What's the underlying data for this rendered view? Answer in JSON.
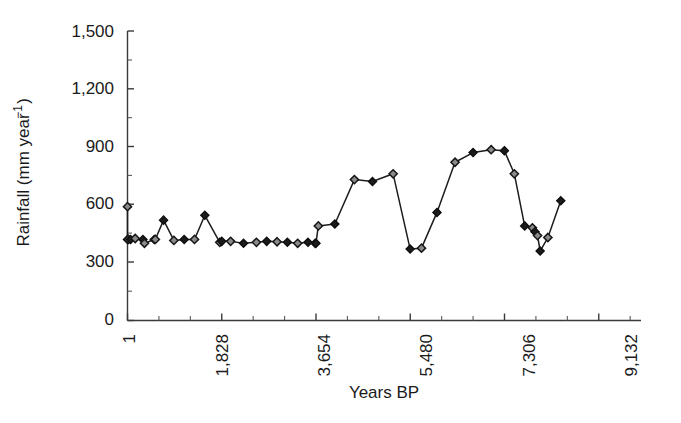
{
  "figure": {
    "background": "#ffffff",
    "line_color": "#1d1d1d",
    "marker_fill": "#8a8a8a",
    "marker_edge": "#161616"
  },
  "chart_data": {
    "type": "line",
    "title": "",
    "subtitle": "",
    "xlabel": "Years BP",
    "ylabel": "Rainfall (mm year⁻¹)",
    "ylabel_plain": "Rainfall (mm year-1)",
    "xlim": [
      1,
      9955
    ],
    "ylim": [
      0,
      1500
    ],
    "grid": false,
    "legend": null,
    "legend_position": "none",
    "marker": "diamond",
    "y_ticks": [
      0,
      300,
      600,
      900,
      1200,
      1500
    ],
    "y_tick_labels": [
      "0",
      "300",
      "600",
      "900",
      "1,200",
      "1,500"
    ],
    "y_minor_interval": 150,
    "x_ticks": [
      1,
      1828,
      3654,
      5480,
      7306,
      9132
    ],
    "x_tick_labels": [
      "1",
      "1,828",
      "3,654",
      "5,480",
      "7,306",
      "9,132"
    ],
    "x_minor_interval": 608.67,
    "x_tick_label_rotation": -90,
    "series": [
      {
        "name": "Rainfall",
        "x": [
          1,
          1,
          20,
          60,
          150,
          300,
          330,
          520,
          540,
          700,
          900,
          1100,
          1300,
          1500,
          1790,
          1828,
          2000,
          2250,
          2500,
          2700,
          2900,
          3100,
          3300,
          3500,
          3640,
          3654,
          3700,
          4020,
          4400,
          4750,
          5150,
          5480,
          5700,
          6000,
          6350,
          6700,
          7050,
          7306,
          7500,
          7700,
          7850,
          7900,
          7950,
          8000,
          8150,
          8400
        ],
        "y": [
          590,
          420,
          420,
          420,
          425,
          420,
          400,
          420,
          420,
          520,
          415,
          420,
          420,
          545,
          405,
          410,
          410,
          400,
          405,
          410,
          408,
          405,
          400,
          405,
          400,
          400,
          490,
          500,
          730,
          720,
          760,
          370,
          375,
          560,
          820,
          870,
          885,
          880,
          760,
          490,
          480,
          460,
          440,
          360,
          430,
          620
        ]
      }
    ]
  },
  "axes": {
    "y_axis_name": "rainfall-axis",
    "x_axis_name": "years-bp-axis"
  }
}
